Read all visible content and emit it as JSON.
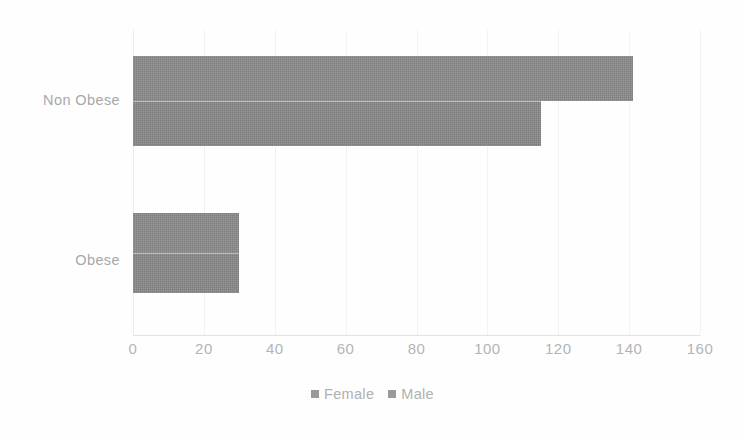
{
  "chart_data": {
    "type": "bar",
    "orientation": "horizontal",
    "title": "",
    "xlabel": "",
    "ylabel": "",
    "categories": [
      "Non Obese",
      "Obese"
    ],
    "series": [
      {
        "name": "Female",
        "values": [
          141,
          30
        ],
        "color": "#8c8c8c"
      },
      {
        "name": "Male",
        "values": [
          115,
          30
        ],
        "color": "#8a8a8a"
      }
    ],
    "xlim": [
      0,
      160
    ],
    "xticks": [
      0,
      20,
      40,
      60,
      80,
      100,
      120,
      140,
      160
    ],
    "xtick_labels": [
      "0",
      "20",
      "40",
      "60",
      "80",
      "100",
      "120",
      "140",
      "160"
    ],
    "grid": true,
    "grid_axis": "x",
    "legend": {
      "position": "bottom",
      "entries": [
        "Female",
        "Male"
      ]
    }
  },
  "legend": {
    "items": [
      {
        "label": "Female",
        "marker": "square-marker-icon"
      },
      {
        "label": "Male",
        "marker": "square-marker-icon"
      }
    ]
  },
  "axis": {
    "category_labels": [
      "Non Obese",
      "Obese"
    ],
    "tick_labels": [
      "0",
      "20",
      "40",
      "60",
      "80",
      "100",
      "120",
      "140",
      "160"
    ]
  },
  "colors": {
    "bar_female": "#8c8c8c",
    "bar_male": "#8a8a8a",
    "text": "#aeaeae",
    "grid": "#f2f2f2",
    "background": "#ffffff"
  }
}
